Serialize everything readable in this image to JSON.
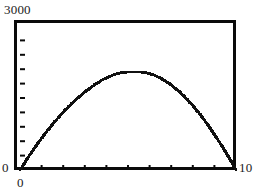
{
  "chart_data": {
    "type": "line",
    "title": "",
    "xlabel": "",
    "ylabel": "",
    "xlim": [
      0,
      10
    ],
    "ylim": [
      0,
      3000
    ],
    "grid": false,
    "legend": null,
    "axis_labels": {
      "y_max": "3000",
      "y_min": "0",
      "x_min": "0",
      "x_max": "10"
    },
    "ticks": {
      "x_count": 10,
      "y_count": 10,
      "x_values": [
        1,
        2,
        3,
        4,
        5,
        6,
        7,
        8,
        9,
        10
      ],
      "y_values": [
        300,
        600,
        900,
        1200,
        1500,
        1800,
        2100,
        2400,
        2700,
        3000
      ],
      "x_tick_labels_shown": false,
      "y_tick_labels_shown": false,
      "direction": "inward"
    },
    "annotations": [],
    "series": [
      {
        "name": "curve",
        "style": "dotted-thick",
        "color": "#111111",
        "x": [
          0.0,
          0.25,
          0.5,
          0.75,
          1.0,
          1.25,
          1.5,
          1.75,
          2.0,
          2.25,
          2.5,
          2.75,
          3.0,
          3.25,
          3.5,
          3.75,
          4.0,
          4.25,
          4.5,
          4.75,
          5.0,
          5.25,
          5.5,
          5.75,
          6.0,
          6.25,
          6.5,
          6.75,
          7.0,
          7.25,
          7.5,
          7.75,
          8.0,
          8.25,
          8.5,
          8.75,
          9.0,
          9.25,
          9.5,
          9.75,
          10.0
        ],
        "y": [
          0,
          180,
          350,
          510,
          665,
          810,
          950,
          1080,
          1205,
          1320,
          1430,
          1530,
          1625,
          1710,
          1790,
          1860,
          1920,
          1970,
          2010,
          2030,
          2040,
          2040,
          2040,
          2035,
          2010,
          1970,
          1915,
          1850,
          1770,
          1680,
          1580,
          1465,
          1340,
          1205,
          1060,
          905,
          740,
          565,
          385,
          195,
          0
        ]
      }
    ]
  }
}
